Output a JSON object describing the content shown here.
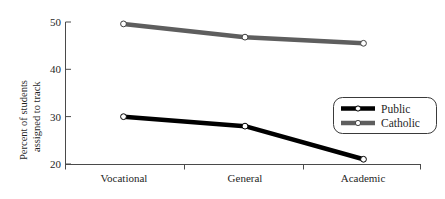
{
  "chart_data": {
    "type": "line",
    "title": "",
    "subtitle": "",
    "xlabel": "",
    "ylabel": "Percent of students assigned to track",
    "ylabel_line1": "Percent of students",
    "ylabel_line2": "assigned to track",
    "categories": [
      "Vocational",
      "General",
      "Academic"
    ],
    "ylim": [
      20,
      50
    ],
    "yticks": [
      20,
      30,
      40,
      50
    ],
    "ytick_labels": [
      "20",
      "30",
      "40",
      "50"
    ],
    "grid": false,
    "legend_position": "right-middle",
    "marker": "open-circle",
    "series": [
      {
        "name": "Public",
        "values": [
          30.0,
          28.0,
          21.0
        ],
        "color": "#000000",
        "marker_face": "#ffffff",
        "line_width": 4.5
      },
      {
        "name": "Catholic",
        "values": [
          49.6,
          46.8,
          45.5
        ],
        "color": "#5e5e5e",
        "marker_face": "#ffffff",
        "line_width": 4.5
      }
    ]
  },
  "legend": {
    "entries": [
      {
        "label": "Public",
        "color": "#000000"
      },
      {
        "label": "Catholic",
        "color": "#5e5e5e"
      }
    ]
  },
  "axis": {
    "y_tick_labels": [
      "50",
      "40",
      "30",
      "20"
    ],
    "x_tick_labels": [
      "Vocational",
      "General",
      "Academic"
    ]
  },
  "colors": {
    "public": "#000000",
    "catholic": "#5e5e5e",
    "axis": "#4a4a4a",
    "text": "#1f1f1f",
    "background": "#ffffff"
  }
}
